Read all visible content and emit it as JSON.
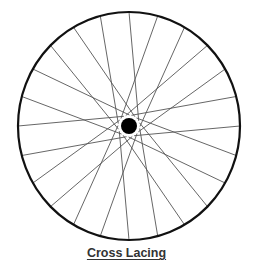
{
  "diagram": {
    "title": "Cross Lacing",
    "wheel": {
      "center": [
        129,
        126
      ],
      "rim_rx": 111,
      "rim_ry": 114,
      "rim_color": "#111111",
      "hub_radius": 8,
      "hub_color": "#000000",
      "spoke_count": 24,
      "spoke_color": "#555555",
      "flange_radius": 11,
      "cross_offset_deg": 62
    }
  }
}
